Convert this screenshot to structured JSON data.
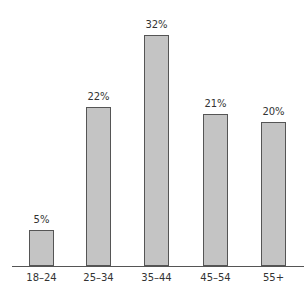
{
  "chart_data": {
    "type": "bar",
    "title": "",
    "xlabel": "",
    "ylabel": "",
    "categories": [
      "18–24",
      "25–34",
      "35–44",
      "45–54",
      "55+"
    ],
    "values": [
      5,
      22,
      32,
      21,
      20
    ],
    "value_labels": [
      "5%",
      "22%",
      "32%",
      "21%",
      "20%"
    ],
    "ylim": [
      0,
      33
    ],
    "grid": false,
    "legend": null,
    "bar_color": "#c4c4c4",
    "bar_edge_color": "#555555"
  }
}
